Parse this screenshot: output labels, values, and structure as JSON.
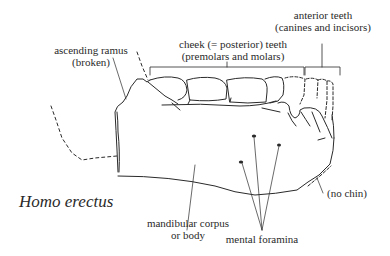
{
  "diagram": {
    "species": "Homo erectus",
    "labels": {
      "ascending_ramus": {
        "line1": "ascending ramus",
        "line2": "(broken)"
      },
      "cheek_teeth": {
        "line1": "cheek (= posterior) teeth",
        "line2": "(premolars and molars)"
      },
      "anterior_teeth": {
        "line1": "anterior teeth",
        "line2": "(canines and incisors)"
      },
      "mandibular_corpus": {
        "line1": "mandibular corpus",
        "line2": "or body"
      },
      "mental_foramina": "mental foramina",
      "no_chin": "(no chin)"
    },
    "colors": {
      "ink": "#2a2a2a",
      "background": "#ffffff"
    }
  }
}
